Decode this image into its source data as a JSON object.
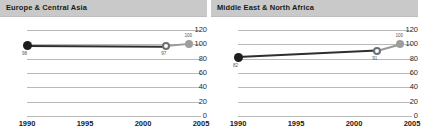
{
  "panels": [
    {
      "title": "Europe & Central Asia",
      "chart_data": {
        "type": "line",
        "title": "Europe & Central Asia",
        "xlabel": "",
        "ylabel": "",
        "xlim": [
          1990,
          2005
        ],
        "ylim": [
          0,
          120
        ],
        "grid": true,
        "legend": false,
        "xticks": [
          "1990",
          "1995",
          "2000",
          "2005"
        ],
        "yticks": [
          "0",
          "20",
          "40",
          "60",
          "80",
          "100",
          "120"
        ],
        "x": [
          1990,
          2002,
          2004
        ],
        "values": [
          98,
          97,
          100
        ],
        "point_labels": [
          "98",
          "97",
          "100"
        ]
      }
    },
    {
      "title": "Middle East & North Africa",
      "chart_data": {
        "type": "line",
        "title": "Middle East & North Africa",
        "xlabel": "",
        "ylabel": "",
        "xlim": [
          1990,
          2005
        ],
        "ylim": [
          0,
          120
        ],
        "grid": true,
        "legend": false,
        "xticks": [
          "1990",
          "1995",
          "2000",
          "2005"
        ],
        "yticks": [
          "0",
          "20",
          "40",
          "60",
          "80",
          "100",
          "120"
        ],
        "x": [
          1990,
          2002,
          2004
        ],
        "values": [
          82,
          91,
          100
        ],
        "point_labels": [
          "82",
          "91",
          "100"
        ]
      }
    }
  ],
  "colors": {
    "header_bg": "#c9c9c9",
    "grid": "#b9b9b9",
    "line_dark": "#2e2e2e",
    "line_light": "#9a9a9a",
    "marker_start": "#1e1e1e",
    "marker_mid_stroke": "#6f6f6f",
    "marker_end": "#9e9e9e",
    "text": "#1a1a1a"
  }
}
